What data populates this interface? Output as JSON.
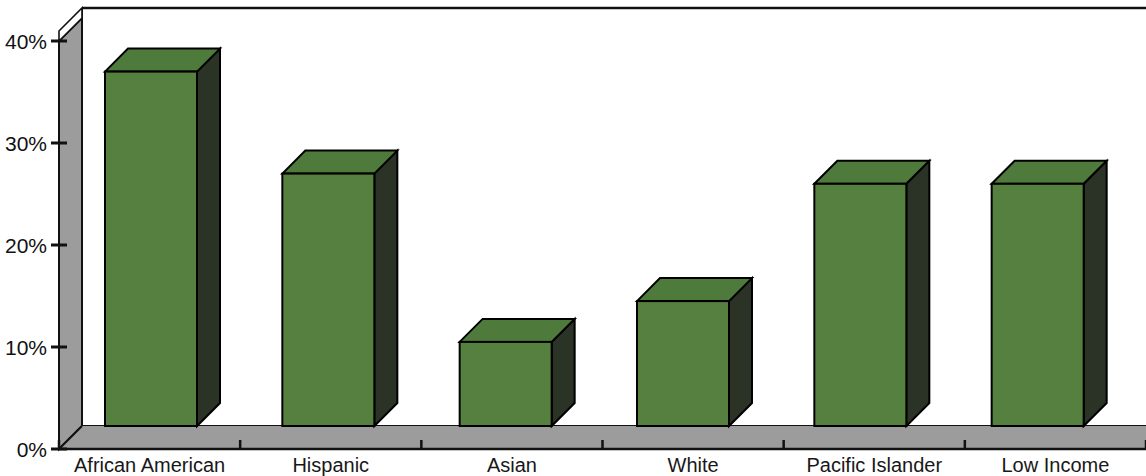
{
  "chart_data": {
    "type": "bar",
    "title": "",
    "subtitle": "",
    "xlabel": "",
    "ylabel": "",
    "categories": [
      "African American",
      "Hispanic",
      "Asian",
      "White",
      "Pacific Islander",
      "Low Income"
    ],
    "values": [
      37,
      27,
      10.5,
      14.5,
      26,
      26
    ],
    "value_labels": [
      "37%",
      "27%",
      "10.5%",
      "14.5%",
      "26%",
      "26%"
    ],
    "ylim": [
      0,
      40
    ],
    "ytick_values": [
      0,
      10,
      20,
      30,
      40
    ],
    "ytick_labels": [
      "0%",
      "10%",
      "20%",
      "30%",
      "40%"
    ],
    "grid": false,
    "legend": null,
    "style": "3d-column",
    "series": [
      {
        "name": "",
        "values": [
          37,
          27,
          10.5,
          14.5,
          26,
          26
        ]
      }
    ],
    "colors": {
      "bar_front": "#558040",
      "bar_top": "#4E7A3C",
      "bar_side": "#2A3326",
      "floor": "#9C9C9C",
      "wall": "#9C9C9C",
      "outline": "#000000",
      "text": "#111111",
      "background": "#FFFFFF"
    }
  },
  "axes": {
    "y_axis_name": "percentage-axis",
    "x_axis_name": "category-axis"
  }
}
